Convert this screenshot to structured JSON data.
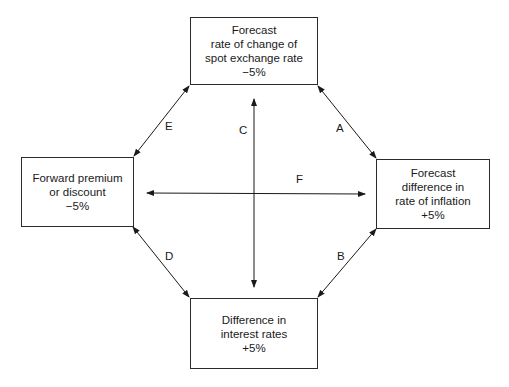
{
  "nodes": {
    "top": {
      "lines": [
        "Forecast",
        "rate of change of",
        "spot exchange rate",
        "−5%"
      ]
    },
    "left": {
      "lines": [
        "Forward premium",
        "or discount",
        "−5%"
      ]
    },
    "right": {
      "lines": [
        "Forecast",
        "difference in",
        "rate of inflation",
        "+5%"
      ]
    },
    "bottom": {
      "lines": [
        "Difference in",
        "interest rates",
        "+5%"
      ]
    }
  },
  "edges": {
    "A": "A",
    "B": "B",
    "C": "C",
    "D": "D",
    "E": "E",
    "F": "F"
  }
}
